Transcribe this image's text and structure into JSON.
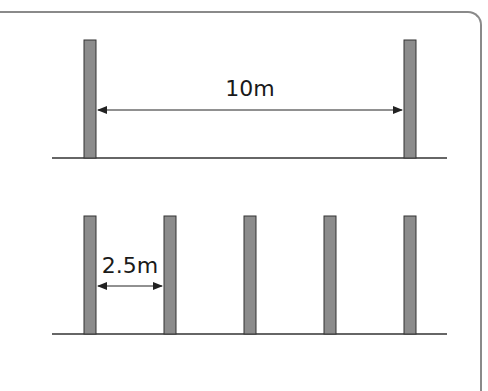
{
  "diagram": {
    "top": {
      "label": "10m",
      "posts": [
        84,
        404
      ],
      "post_top": 40,
      "ground_y": 158,
      "arrow_y": 110,
      "arrow_from": 97,
      "arrow_to": 403
    },
    "bottom": {
      "label": "2.5m",
      "posts": [
        84,
        164,
        244,
        324,
        404
      ],
      "post_top": 26,
      "ground_y": 334,
      "arrow_y": 286,
      "arrow_from": 97,
      "arrow_to": 163
    },
    "ground_x": [
      52,
      447
    ],
    "post_width": 12,
    "colors": {
      "post_fill": "#8c8c8c",
      "post_stroke": "#333333",
      "line": "#333333",
      "frame": "#8a8a8a"
    }
  }
}
